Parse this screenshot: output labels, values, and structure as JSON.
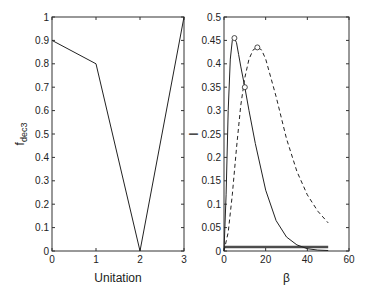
{
  "chart_data": [
    {
      "type": "line",
      "title": "",
      "xlabel": "Unitation",
      "ylabel": "f",
      "ylabel_subscript": "dec3",
      "xlim": [
        0,
        3
      ],
      "ylim": [
        0,
        1
      ],
      "xticks": [
        "0",
        "1",
        "2",
        "3"
      ],
      "yticks": [
        "0",
        "0.1",
        "0.2",
        "0.3",
        "0.4",
        "0.5",
        "0.6",
        "0.7",
        "0.8",
        "0.9",
        "1"
      ],
      "grid": false,
      "series": [
        {
          "name": "f_dec3",
          "style": "solid",
          "x": [
            0,
            1,
            2,
            3
          ],
          "y": [
            0.9,
            0.8,
            0,
            1
          ]
        }
      ]
    },
    {
      "type": "line",
      "title": "",
      "xlabel": "β",
      "ylabel": "I",
      "xlim": [
        0,
        60
      ],
      "ylim": [
        0,
        0.5
      ],
      "xticks": [
        "0",
        "20",
        "40",
        "60"
      ],
      "yticks": [
        "0",
        "0.05",
        "0.1",
        "0.15",
        "0.2",
        "0.25",
        "0.3",
        "0.35",
        "0.4",
        "0.45",
        "0.5"
      ],
      "grid": false,
      "series": [
        {
          "name": "solid",
          "style": "solid",
          "x": [
            0,
            1,
            2,
            3,
            4,
            5,
            6,
            7,
            8,
            10,
            12,
            15,
            20,
            25,
            30,
            35,
            40,
            45,
            50
          ],
          "y": [
            0.0,
            0.12,
            0.3,
            0.41,
            0.45,
            0.455,
            0.445,
            0.42,
            0.395,
            0.35,
            0.3,
            0.23,
            0.13,
            0.065,
            0.03,
            0.013,
            0.005,
            0.002,
            0.001
          ]
        },
        {
          "name": "dashed",
          "style": "dashed",
          "x": [
            0,
            2,
            4,
            6,
            8,
            10,
            12,
            14,
            16,
            18,
            20,
            25,
            30,
            35,
            40,
            45,
            50
          ],
          "y": [
            0.0,
            0.04,
            0.12,
            0.22,
            0.31,
            0.37,
            0.41,
            0.43,
            0.435,
            0.43,
            0.41,
            0.33,
            0.24,
            0.17,
            0.12,
            0.085,
            0.06
          ]
        },
        {
          "name": "baseline-1",
          "style": "solid",
          "x": [
            0,
            50
          ],
          "y": [
            0.007,
            0.007
          ]
        },
        {
          "name": "baseline-2",
          "style": "solid",
          "x": [
            0,
            50
          ],
          "y": [
            0.01,
            0.01
          ]
        }
      ],
      "markers": [
        {
          "x": 5,
          "y": 0.455,
          "shape": "circle"
        },
        {
          "x": 16,
          "y": 0.435,
          "shape": "circle"
        },
        {
          "x": 10,
          "y": 0.35,
          "shape": "circle"
        }
      ]
    }
  ]
}
